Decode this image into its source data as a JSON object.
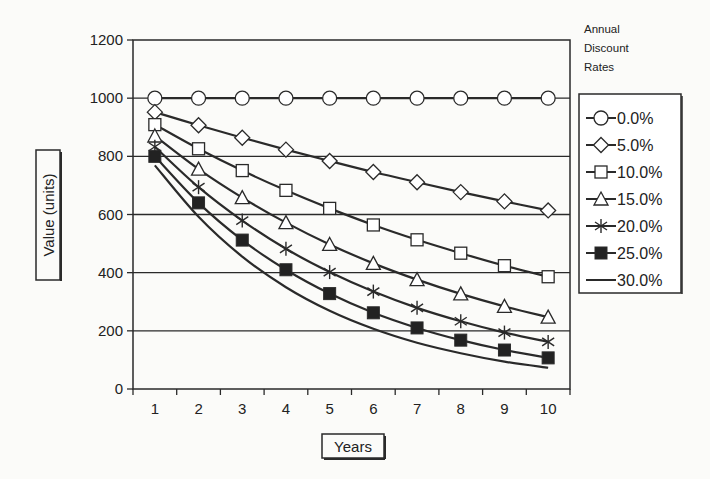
{
  "chart_data": {
    "type": "line",
    "title": "",
    "xlabel": "Years",
    "ylabel": "Value (units)",
    "x": [
      1,
      2,
      3,
      4,
      5,
      6,
      7,
      8,
      9,
      10
    ],
    "ylim": [
      0,
      1200
    ],
    "yticks": [
      0,
      200,
      400,
      600,
      800,
      1000,
      1200
    ],
    "grid": "horizontal",
    "legend_title": [
      "Annual",
      "Discount",
      "Rates"
    ],
    "legend_position": "right",
    "series": [
      {
        "name": "0.0%",
        "marker": "circle-open",
        "values": [
          1000,
          1000,
          1000,
          1000,
          1000,
          1000,
          1000,
          1000,
          1000,
          1000
        ]
      },
      {
        "name": "5.0%",
        "marker": "diamond-open",
        "values": [
          952,
          907,
          864,
          823,
          784,
          746,
          711,
          677,
          645,
          614
        ]
      },
      {
        "name": "10.0%",
        "marker": "square-open",
        "values": [
          909,
          826,
          751,
          683,
          621,
          564,
          513,
          467,
          424,
          386
        ]
      },
      {
        "name": "15.0%",
        "marker": "triangle-open",
        "values": [
          870,
          756,
          658,
          572,
          497,
          432,
          376,
          327,
          284,
          247
        ]
      },
      {
        "name": "20.0%",
        "marker": "asterisk",
        "values": [
          833,
          694,
          579,
          482,
          402,
          335,
          279,
          233,
          194,
          162
        ]
      },
      {
        "name": "25.0%",
        "marker": "square-filled",
        "values": [
          800,
          640,
          512,
          410,
          328,
          262,
          210,
          168,
          134,
          107
        ]
      },
      {
        "name": "30.0%",
        "marker": "none",
        "values": [
          769,
          592,
          455,
          350,
          269,
          207,
          159,
          123,
          94,
          73
        ]
      }
    ]
  }
}
